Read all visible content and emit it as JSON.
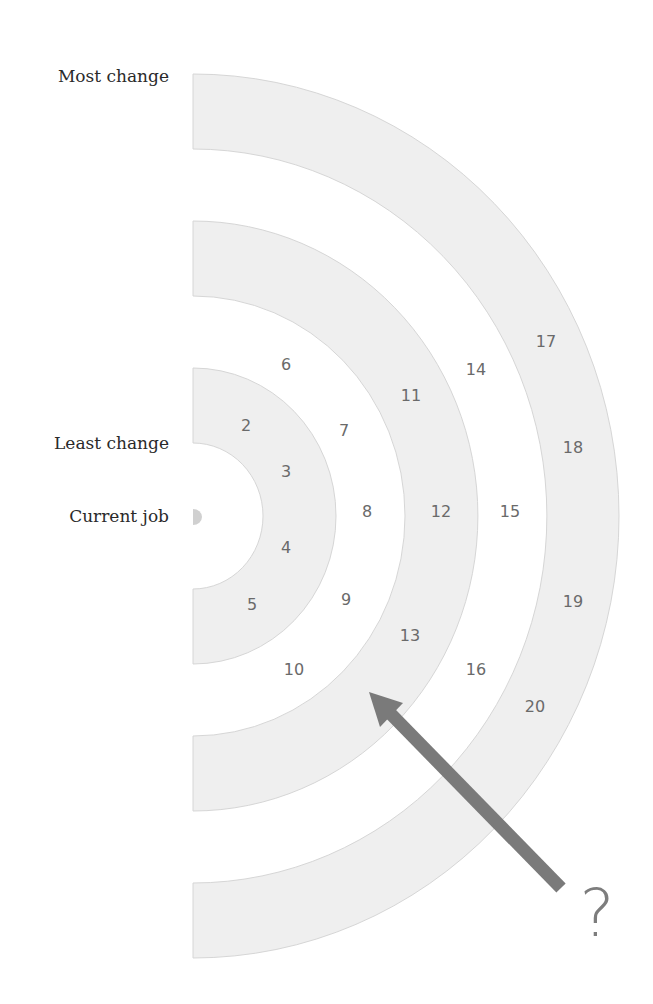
{
  "labels": {
    "most_change": "Most change",
    "least_change": "Least change",
    "current_job": "Current job"
  },
  "question_mark": "?",
  "colors": {
    "ring_fill": "#efefef",
    "ring_edge": "#d6d6d6",
    "center_dot": "#d0d0d0",
    "arrow": "#7a7a7a",
    "number_text": "#6a6a6a",
    "label_text": "#2a2a2a"
  },
  "rings": [
    {
      "name": "inner",
      "r_inner": 70,
      "r_outer": 143
    },
    {
      "name": "middle",
      "r_inner": 212,
      "r_outer": 285
    },
    {
      "name": "outer",
      "r_inner": 354,
      "r_outer": 426
    }
  ],
  "numbers": [
    {
      "value": "2",
      "x": 246,
      "y": 426
    },
    {
      "value": "3",
      "x": 286,
      "y": 472
    },
    {
      "value": "4",
      "x": 286,
      "y": 548
    },
    {
      "value": "5",
      "x": 252,
      "y": 605
    },
    {
      "value": "6",
      "x": 286,
      "y": 365
    },
    {
      "value": "7",
      "x": 344,
      "y": 431
    },
    {
      "value": "8",
      "x": 367,
      "y": 512
    },
    {
      "value": "9",
      "x": 346,
      "y": 600
    },
    {
      "value": "10",
      "x": 294,
      "y": 670
    },
    {
      "value": "11",
      "x": 411,
      "y": 396
    },
    {
      "value": "12",
      "x": 441,
      "y": 512
    },
    {
      "value": "13",
      "x": 410,
      "y": 636
    },
    {
      "value": "14",
      "x": 476,
      "y": 370
    },
    {
      "value": "15",
      "x": 510,
      "y": 512
    },
    {
      "value": "16",
      "x": 476,
      "y": 670
    },
    {
      "value": "17",
      "x": 546,
      "y": 342
    },
    {
      "value": "18",
      "x": 573,
      "y": 448
    },
    {
      "value": "19",
      "x": 573,
      "y": 602
    },
    {
      "value": "20",
      "x": 535,
      "y": 707
    }
  ]
}
